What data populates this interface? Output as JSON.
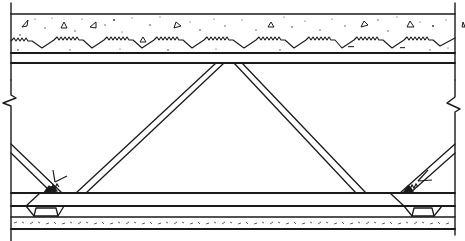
{
  "diagram": {
    "title": "",
    "type": "construction-section-detail",
    "colors": {
      "background": "#ffffff",
      "ink": "#1a1a1a",
      "speckle": "#3a3a3a"
    },
    "components": [
      {
        "id": "concrete-slab",
        "label": ""
      },
      {
        "id": "metal-deck-corrugation",
        "label": ""
      },
      {
        "id": "top-chord",
        "label": ""
      },
      {
        "id": "web-diagonals",
        "label": ""
      },
      {
        "id": "weld-symbol-left",
        "label": ""
      },
      {
        "id": "weld-symbol-right",
        "label": ""
      },
      {
        "id": "bottom-chord",
        "label": ""
      },
      {
        "id": "bearing-seat-left",
        "label": ""
      },
      {
        "id": "bearing-seat-right",
        "label": ""
      },
      {
        "id": "bottom-speckled-strip",
        "label": ""
      },
      {
        "id": "break-line-left",
        "label": ""
      },
      {
        "id": "break-line-right",
        "label": ""
      }
    ]
  }
}
